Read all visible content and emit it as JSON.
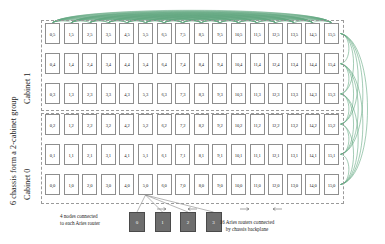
{
  "diagram": {
    "grid": {
      "columns": 16,
      "rows": 6,
      "row_order": [
        5,
        4,
        3,
        2,
        1,
        0
      ],
      "cell_label_format": "col,row",
      "cells": [
        [
          "0,5",
          "1,5",
          "2,5",
          "3,5",
          "4,5",
          "5,5",
          "6,5",
          "7,5",
          "8,5",
          "9,5",
          "10,5",
          "11,5",
          "12,5",
          "13,5",
          "14,5",
          "15,5"
        ],
        [
          "0,4",
          "1,4",
          "2,4",
          "3,4",
          "4,4",
          "5,4",
          "6,4",
          "7,4",
          "8,4",
          "9,4",
          "10,4",
          "11,4",
          "12,4",
          "13,4",
          "14,4",
          "15,4"
        ],
        [
          "0,3",
          "1,3",
          "2,3",
          "3,3",
          "4,3",
          "5,3",
          "6,3",
          "7,3",
          "8,3",
          "9,3",
          "10,3",
          "11,3",
          "12,3",
          "13,3",
          "14,3",
          "15,3"
        ],
        [
          "0,2",
          "1,2",
          "2,2",
          "3,2",
          "4,2",
          "5,2",
          "6,2",
          "7,2",
          "8,2",
          "9,2",
          "10,2",
          "11,2",
          "12,2",
          "13,2",
          "14,2",
          "15,2"
        ],
        [
          "0,1",
          "1,1",
          "2,1",
          "3,1",
          "4,1",
          "5,1",
          "6,1",
          "7,1",
          "8,1",
          "9,1",
          "10,1",
          "11,1",
          "12,1",
          "13,1",
          "14,1",
          "15,1"
        ],
        [
          "0,0",
          "1,0",
          "2,0",
          "3,0",
          "4,0",
          "5,0",
          "6,0",
          "7,0",
          "8,0",
          "9,0",
          "10,0",
          "11,0",
          "12,0",
          "13,0",
          "14,0",
          "15,0"
        ]
      ]
    },
    "side_labels": {
      "group": "6 chassis form a 2-cabinet group",
      "cabinet_1": "Cabinet 1",
      "cabinet_0": "Cabinet 0"
    },
    "nodes": {
      "labels": [
        "0",
        "1",
        "2",
        "3"
      ],
      "attached_to_cell": "5,0"
    },
    "captions": {
      "nodes": "4 nodes connected\nto each Aries router",
      "routers": "16 Aries routers connected\nby chassis backplane"
    },
    "colors": {
      "green_link": "#2e8b57",
      "cell_border": "#8e8e8e",
      "cabinet_border": "#9a9a9a",
      "node_fill": "#6e6e6e",
      "text": "#1a1a1a"
    }
  }
}
